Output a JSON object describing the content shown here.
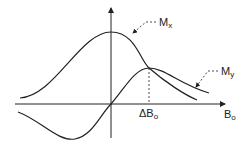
{
  "labels": {
    "mx_main": "M",
    "mx_sub": "x",
    "my_main": "M",
    "my_sub": "y",
    "delta_main": "ΔB",
    "delta_sub": "o",
    "bo_main": "B",
    "bo_sub": "o"
  },
  "colors": {
    "line": "#222222"
  }
}
